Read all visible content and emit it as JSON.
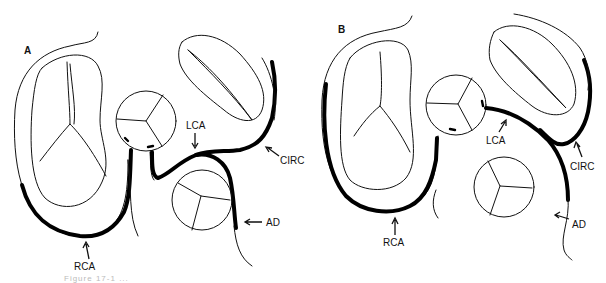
{
  "figure": {
    "caption_visible_fragment": "Figure 17-1 ...",
    "colors": {
      "ink": "#000000",
      "background": "#ffffff",
      "stipple": "#d9d9d9"
    }
  },
  "panels": [
    {
      "id": "A",
      "label": "A",
      "labels": {
        "lca": "LCA",
        "circ": "CIRC",
        "ad": "AD",
        "rca": "RCA"
      }
    },
    {
      "id": "B",
      "label": "B",
      "labels": {
        "lca": "LCA",
        "circ": "CIRC",
        "ad": "AD",
        "rca": "RCA"
      }
    }
  ]
}
